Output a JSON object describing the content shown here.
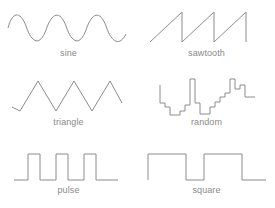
{
  "figure": {
    "background_color": "#ffffff",
    "stroke_color": "#8c8c8c",
    "label_color": "#8a8a8a",
    "width": 275,
    "height": 208,
    "columns": 2,
    "rows": 3
  },
  "chart_data": {
    "type": "line",
    "title": "",
    "xlabel": "",
    "ylabel": "",
    "grid": false,
    "legend": "none",
    "panel_layout": {
      "rows": 3,
      "cols": 2
    },
    "panels": [
      {
        "name": "sine",
        "label": "sine",
        "row": 0,
        "col": 0,
        "description": "smooth sinusoid, three full cycles",
        "cycles": 3,
        "amplitude": 1,
        "x": [
          0,
          0.05,
          0.1,
          0.15,
          0.2,
          0.25,
          0.3,
          0.35,
          0.4,
          0.45,
          0.5,
          0.55,
          0.6,
          0.65,
          0.7,
          0.75,
          0.8,
          0.85,
          0.9,
          0.95,
          1
        ],
        "values": [
          0.59,
          1.0,
          0.81,
          0.16,
          -0.59,
          -1.0,
          -0.76,
          -0.08,
          0.67,
          1.0,
          0.71,
          0.0,
          -0.74,
          -1.0,
          -0.64,
          0.08,
          0.81,
          0.99,
          0.56,
          -0.16,
          -0.84
        ],
        "path": "M 8,28 C 12,12 20,10 26,26 C 32,44 40,46 46,30 C 52,12 60,10 66,26 C 72,44 80,46 86,30 C 92,12 100,10 106,26 C 112,44 120,46 126,34",
        "viewbox": "0 0 137 52"
      },
      {
        "name": "sawtooth",
        "label": "sawtooth",
        "row": 0,
        "col": 1,
        "description": "three rising ramps each followed by a vertical drop",
        "cycles": 3,
        "amplitude": 1,
        "x": [
          0,
          0.33,
          0.33,
          0.66,
          0.66,
          1.0,
          1.0
        ],
        "values": [
          -0.4,
          1.0,
          -1.0,
          1.0,
          -1.0,
          1.0,
          -1.0
        ],
        "path": "M 12,42 L 44,12 L 44,42 L 76,12 L 76,42 L 108,12 L 108,42",
        "viewbox": "0 0 137 52"
      },
      {
        "name": "triangle",
        "label": "triangle",
        "row": 1,
        "col": 0,
        "description": "three symmetric up-down triangular peaks",
        "cycles": 3,
        "amplitude": 1,
        "x": [
          0,
          0.1,
          0.27,
          0.43,
          0.6,
          0.77,
          0.93,
          1.0
        ],
        "values": [
          -0.6,
          -1.0,
          1.0,
          -1.0,
          1.0,
          -1.0,
          1.0,
          -0.3
        ],
        "path": "M 12,38 L 20,42 L 38,12 L 56,42 L 74,12 L 92,42 L 110,12 L 122,34",
        "viewbox": "0 0 137 52"
      },
      {
        "name": "random",
        "label": "random",
        "row": 1,
        "col": 1,
        "description": "irregular staircase of random-height steps",
        "steps": 22,
        "x": [
          0,
          1,
          2,
          3,
          4,
          5,
          6,
          7,
          8,
          9,
          10,
          11,
          12,
          13,
          14,
          15,
          16,
          17,
          18,
          19,
          20,
          21
        ],
        "values": [
          0.55,
          0.55,
          -0.25,
          -0.4,
          -0.85,
          -0.85,
          -0.55,
          -0.55,
          -0.2,
          -0.2,
          0.95,
          0.95,
          -0.1,
          -0.1,
          -0.8,
          -0.45,
          -0.1,
          0.2,
          0.95,
          0.35,
          0.35,
          -0.1
        ],
        "path": "M 22,16 L 22,34 L 27,34 L 27,38 L 32,38 L 32,46 L 42,46 L 42,42 L 47,42 L 47,36 L 52,36 L 52,10 L 57,10 L 57,34 L 62,34 L 62,45 L 72,45 L 72,38 L 77,38 L 77,33 L 82,33 L 82,28 L 87,28 L 87,24 L 92,24 L 92,10 L 97,10 L 97,20 L 102,20 L 102,16 L 107,16 L 107,28 L 117,28",
        "viewbox": "0 0 137 52"
      },
      {
        "name": "pulse",
        "label": "pulse",
        "row": 2,
        "col": 0,
        "description": "three narrow high pulses on a low baseline, low duty cycle",
        "pulses": 3,
        "duty_cycle": 0.22,
        "x": [
          0,
          0.12,
          0.12,
          0.28,
          0.28,
          0.42,
          0.42,
          0.58,
          0.58,
          0.72,
          0.72,
          0.88,
          0.88,
          1.0
        ],
        "values": [
          -1,
          -1,
          1,
          1,
          -1,
          -1,
          1,
          1,
          -1,
          -1,
          1,
          1,
          -1,
          -1
        ],
        "path": "M 14,42 L 28,42 L 28,16 L 40,16 L 40,42 L 56,42 L 56,16 L 68,16 L 68,42 L 84,42 L 84,16 L 96,16 L 96,42 L 118,42",
        "viewbox": "0 0 137 52"
      },
      {
        "name": "square",
        "label": "square",
        "row": 2,
        "col": 1,
        "description": "two full high periods with 50 percent duty cycle",
        "cycles": 2,
        "duty_cycle": 0.5,
        "x": [
          0,
          0.08,
          0.08,
          0.42,
          0.42,
          0.58,
          0.58,
          0.88,
          0.88,
          1.0
        ],
        "values": [
          -1,
          -1,
          1,
          1,
          -1,
          -1,
          1,
          1,
          -1,
          -1
        ],
        "path": "M 10,42 L 10,16 L 48,16 L 48,42 L 66,42 L 66,16 L 104,16 L 104,42 L 128,42",
        "viewbox": "0 0 137 52"
      }
    ]
  }
}
